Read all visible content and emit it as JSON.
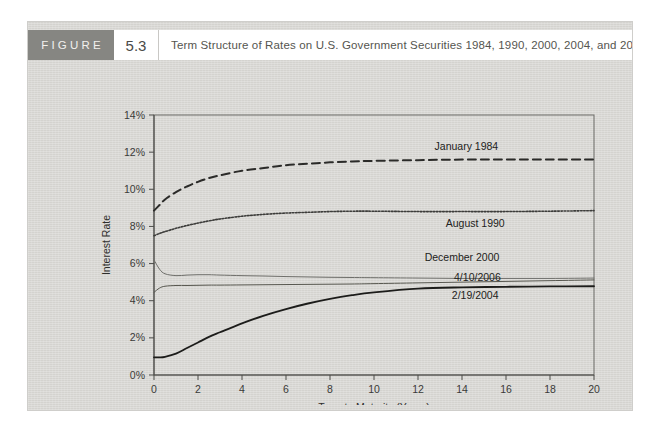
{
  "figure": {
    "label": "FIGURE",
    "number": "5.3",
    "title": "Term Structure of Rates on U.S. Government Securities 1984, 1990, 2000, 2004, and 2006"
  },
  "colors": {
    "panel_background": "#d8d7d3",
    "header_block": "#868682",
    "header_text": "#f2f1ee",
    "title_text": "#55554f",
    "axis": "#4c4c49",
    "series_1984": "#2b2b29",
    "series_1990": "#3c3c3a",
    "series_2000": "#6f6f6b",
    "series_2006": "#57574f",
    "series_2004": "#1c1c1a"
  },
  "chart_data": {
    "type": "line",
    "title": "Term Structure of Rates on U.S. Government Securities 1984, 1990, 2000, 2004, and 2006",
    "xlabel": "Term to Maturity (Years)",
    "ylabel": "Interest Rate",
    "xlim": [
      0,
      20
    ],
    "ylim": [
      0,
      14
    ],
    "xticks": [
      0,
      2,
      4,
      6,
      8,
      10,
      12,
      14,
      16,
      18,
      20
    ],
    "xtick_labels": [
      "0",
      "2",
      "4",
      "6",
      "8",
      "10",
      "12",
      "14",
      "16",
      "18",
      "20"
    ],
    "yticks": [
      0,
      2,
      4,
      6,
      8,
      10,
      12,
      14
    ],
    "ytick_labels": [
      "0%",
      "2%",
      "4%",
      "6%",
      "8%",
      "10%",
      "12%",
      "14%"
    ],
    "grid": false,
    "legend": "inline-labels",
    "x": [
      0,
      0.25,
      0.5,
      1,
      1.5,
      2,
      2.5,
      3,
      4,
      5,
      6,
      7,
      8,
      9,
      10,
      12,
      14,
      16,
      18,
      20
    ],
    "series": [
      {
        "name": "January 1984",
        "style": "dashed",
        "label_x": 14.2,
        "label_y": 12.3,
        "values": [
          8.85,
          9.15,
          9.45,
          9.85,
          10.15,
          10.4,
          10.6,
          10.75,
          11.0,
          11.15,
          11.3,
          11.38,
          11.45,
          11.5,
          11.53,
          11.57,
          11.6,
          11.6,
          11.6,
          11.6
        ]
      },
      {
        "name": "August 1990",
        "style": "dotted",
        "label_x": 14.6,
        "label_y": 8.15,
        "values": [
          7.5,
          7.62,
          7.72,
          7.9,
          8.05,
          8.18,
          8.3,
          8.4,
          8.55,
          8.65,
          8.72,
          8.76,
          8.8,
          8.82,
          8.82,
          8.8,
          8.8,
          8.8,
          8.82,
          8.85
        ]
      },
      {
        "name": "December 2000",
        "style": "solid-light",
        "label_x": 14.0,
        "label_y": 6.35,
        "values": [
          6.2,
          5.7,
          5.45,
          5.35,
          5.38,
          5.4,
          5.4,
          5.38,
          5.35,
          5.33,
          5.3,
          5.28,
          5.26,
          5.25,
          5.24,
          5.22,
          5.2,
          5.2,
          5.2,
          5.22
        ]
      },
      {
        "name": "4/10/2006",
        "style": "solid-medium",
        "label_x": 14.7,
        "label_y": 5.25,
        "values": [
          4.45,
          4.68,
          4.78,
          4.82,
          4.82,
          4.83,
          4.84,
          4.84,
          4.85,
          4.86,
          4.87,
          4.88,
          4.89,
          4.9,
          4.92,
          4.96,
          5.0,
          5.04,
          5.08,
          5.12
        ]
      },
      {
        "name": "2/19/2004",
        "style": "solid-dark",
        "label_x": 14.6,
        "label_y": 4.3,
        "values": [
          0.95,
          0.95,
          0.98,
          1.15,
          1.45,
          1.75,
          2.05,
          2.3,
          2.78,
          3.2,
          3.55,
          3.85,
          4.1,
          4.3,
          4.45,
          4.65,
          4.72,
          4.75,
          4.77,
          4.78
        ]
      }
    ]
  }
}
